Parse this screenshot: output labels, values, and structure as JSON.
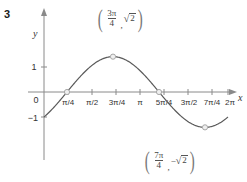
{
  "problem": {
    "number": "3"
  },
  "chart_data": {
    "type": "line",
    "title": "",
    "function": "y = √2 sin(x − π/4)",
    "xlabel": "x",
    "ylabel": "y",
    "xlim": [
      0,
      6.2832
    ],
    "ylim": [
      -1.6,
      1.6
    ],
    "grid": false,
    "legend": null,
    "x_ticks": [
      {
        "value": 0.7854,
        "label": "π/4"
      },
      {
        "value": 1.5708,
        "label": "π/2"
      },
      {
        "value": 2.3562,
        "label": "3π/4"
      },
      {
        "value": 3.1416,
        "label": "π"
      },
      {
        "value": 3.927,
        "label": "5π/4"
      },
      {
        "value": 4.7124,
        "label": "3π/2"
      },
      {
        "value": 5.4978,
        "label": "7π/4"
      },
      {
        "value": 6.2832,
        "label": "2π"
      }
    ],
    "y_ticks": [
      {
        "value": 1,
        "label": "1"
      },
      {
        "value": 0,
        "label": "0"
      },
      {
        "value": -1,
        "label": "−1"
      }
    ],
    "x": [
      0,
      0.3927,
      0.7854,
      1.1781,
      1.5708,
      1.9635,
      2.3562,
      2.7489,
      3.1416,
      3.5343,
      3.927,
      4.3197,
      4.7124,
      5.1051,
      5.4978,
      5.8905,
      6.2832
    ],
    "y": [
      -1,
      -0.5412,
      0,
      0.5412,
      1,
      1.3066,
      1.4142,
      1.3066,
      1,
      0.5412,
      0,
      -0.5412,
      -1,
      -1.3066,
      -1.4142,
      -1.3066,
      -1
    ],
    "markers": [
      {
        "x": 0.7854,
        "y": 0,
        "label": ""
      },
      {
        "x": 2.3562,
        "y": 1.4142,
        "label": "max"
      },
      {
        "x": 3.927,
        "y": 0,
        "label": ""
      },
      {
        "x": 5.4978,
        "y": -1.4142,
        "label": "min"
      }
    ],
    "annotations": [
      {
        "id": "max-point-label",
        "x": 2.3562,
        "y": 1.4142,
        "fraction_numerator": "3π",
        "fraction_denominator": "4",
        "separator": ",",
        "second": "√2",
        "second_radicand": "2",
        "negative": false,
        "text": "(3π/4, √2)"
      },
      {
        "id": "min-point-label",
        "x": 5.4978,
        "y": -1.4142,
        "fraction_numerator": "7π",
        "fraction_denominator": "4",
        "separator": ",",
        "second": "−√2",
        "second_radicand": "2",
        "negative": true,
        "text": "(7π/4, −√2)"
      }
    ],
    "colors": {
      "curve": "#5a5a5a",
      "axis": "#8a8a8a",
      "marker_fill": "#efefef",
      "marker_stroke": "#a8a8a8",
      "text": "#333333"
    }
  }
}
